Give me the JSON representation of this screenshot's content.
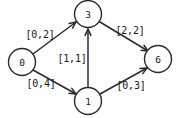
{
  "diagram": {
    "colors": {
      "background": "#fdfdfd",
      "stroke": "#2b2b2b",
      "text": "#1a1a1a",
      "node_fill": "#fdfdfd"
    },
    "nodes": [
      {
        "id": "0",
        "label": "0",
        "cx": 22,
        "cy": 62,
        "r": 13.5
      },
      {
        "id": "3",
        "label": "3",
        "cx": 88,
        "cy": 14,
        "r": 13.5
      },
      {
        "id": "1",
        "label": "1",
        "cx": 88,
        "cy": 101,
        "r": 13.5
      },
      {
        "id": "6",
        "label": "6",
        "cx": 158,
        "cy": 59,
        "r": 13.5
      }
    ],
    "edges": [
      {
        "id": "e0-3",
        "from": "0",
        "to": "3",
        "label": "[0,2]",
        "label_x": 40,
        "label_y": 34,
        "x1": 33,
        "y1": 54,
        "x2": 76,
        "y2": 22,
        "arrow": {
          "x": 76,
          "y": 22,
          "angle": -36.6
        }
      },
      {
        "id": "e0-1",
        "from": "0",
        "to": "1",
        "label": "[0,4]",
        "label_x": 41,
        "label_y": 83,
        "x1": 33,
        "y1": 70,
        "x2": 76,
        "y2": 94,
        "arrow": {
          "x": 76,
          "y": 94,
          "angle": 29.2
        }
      },
      {
        "id": "e1-3",
        "from": "1",
        "to": "3",
        "label": "[1,1]",
        "label_x": 72,
        "label_y": 58,
        "x1": 88,
        "y1": 87,
        "x2": 88,
        "y2": 29,
        "arrow": {
          "x": 88,
          "y": 29,
          "angle": -90
        }
      },
      {
        "id": "e3-6",
        "from": "3",
        "to": "6",
        "label": "[2,2]",
        "label_x": 130,
        "label_y": 30,
        "x1": 100,
        "y1": 22,
        "x2": 148,
        "y2": 51,
        "arrow": {
          "x": 148,
          "y": 51,
          "angle": 31.1
        }
      },
      {
        "id": "e1-6",
        "from": "1",
        "to": "6",
        "label": "[0,3]",
        "label_x": 131,
        "label_y": 85,
        "x1": 100,
        "y1": 94,
        "x2": 147,
        "y2": 68,
        "arrow": {
          "x": 147,
          "y": 68,
          "angle": -29.0
        }
      }
    ]
  }
}
